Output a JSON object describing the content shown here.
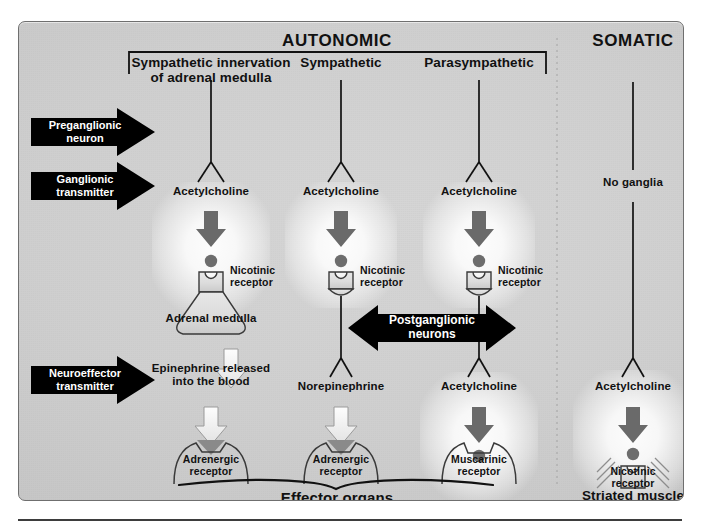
{
  "diagram": {
    "headers": {
      "autonomic": "AUTONOMIC",
      "somatic": "SOMATIC"
    },
    "columns": [
      {
        "id": "sympathetic-adrenal",
        "label": "Sympathetic innervation\nof adrenal medulla",
        "ganglionic_transmitter": "Acetylcholine",
        "ganglionic_receptor": "Nicotinic\nreceptor",
        "ganglion_structure": "Adrenal medulla",
        "neuroeffector_transmitter": "Epinephrine released\ninto the blood",
        "effector_receptor": "Adrenergic\nreceptor"
      },
      {
        "id": "sympathetic",
        "label": "Sympathetic",
        "ganglionic_transmitter": "Acetylcholine",
        "ganglionic_receptor": "Nicotinic\nreceptor",
        "ganglion_structure": "",
        "neuroeffector_transmitter": "Norepinephrine",
        "effector_receptor": "Adrenergic\nreceptor"
      },
      {
        "id": "parasympathetic",
        "label": "Parasympathetic",
        "ganglionic_transmitter": "Acetylcholine",
        "ganglionic_receptor": "Nicotinic\nreceptor",
        "ganglion_structure": "",
        "neuroeffector_transmitter": "Acetylcholine",
        "effector_receptor": "Muscarinic\nreceptor"
      },
      {
        "id": "somatic",
        "label": "",
        "ganglionic_transmitter": "No ganglia",
        "ganglionic_receptor": "",
        "ganglion_structure": "",
        "neuroeffector_transmitter": "Acetylcholine",
        "effector_receptor": "Nicotinic\nreceptor"
      }
    ],
    "row_labels": [
      {
        "id": "preganglionic",
        "text": "Preganglionic\nneuron"
      },
      {
        "id": "ganglionic",
        "text": "Ganglionic\ntransmitter"
      },
      {
        "id": "neuroeffector",
        "text": "Neuroeffector\ntransmitter"
      }
    ],
    "postganglionic_label": "Postganglionic\nneurons",
    "effector_brace_label": "Effector organs",
    "striated_muscle_label": "Striated muscle",
    "icons": {
      "preganglionic_arrow": "right-arrow-icon",
      "ganglionic_arrow": "right-arrow-icon",
      "neuroeffector_arrow": "right-arrow-icon",
      "postganglionic_arrow": "double-headed-arrow-icon",
      "transmitter_dark_arrow": "down-arrow-dark-icon",
      "transmitter_light_arrow": "down-arrow-light-icon",
      "vesicle": "neurotransmitter-dot-icon",
      "adrenergic_marker": "neurotransmitter-wedge-icon",
      "adrenal_medulla": "flask-shape-icon",
      "effector_brace": "curly-brace-icon",
      "striation": "muscle-striation-icon"
    },
    "colors": {
      "panel_bg": "#cfcfcf",
      "ink": "#111111",
      "dark_arrow": "#666666",
      "light_arrow": "#f2f2f2",
      "label_arrow_fill": "#000000",
      "label_arrow_text": "#ffffff",
      "divider": "#b0b0b0"
    }
  }
}
